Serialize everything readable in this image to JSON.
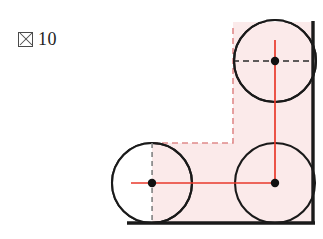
{
  "figure": {
    "caption": {
      "glyph_name": "tofu-box-glyph",
      "glyph_char": "図",
      "number": "10"
    },
    "colors": {
      "fill_pink": "#fbeaea",
      "stroke_red": "#e8392b",
      "stroke_pink_dashed": "#e89a9a",
      "stroke_black": "#1a1a1a",
      "stroke_gray_dashed": "#8a8a8a",
      "background": "#ffffff"
    },
    "geometry": {
      "circles": [
        {
          "name": "circle-top-right",
          "cx": 275,
          "cy": 61,
          "r": 41
        },
        {
          "name": "circle-bottom-left",
          "cx": 152,
          "cy": 183,
          "r": 40
        },
        {
          "name": "circle-bottom-right",
          "cx": 275,
          "cy": 183,
          "r": 40
        }
      ],
      "centers": [
        {
          "name": "center-dot-top-right",
          "x": 275,
          "y": 61
        },
        {
          "name": "center-dot-bottom-left",
          "x": 152,
          "y": 183
        },
        {
          "name": "center-dot-bottom-right",
          "x": 275,
          "y": 183
        }
      ],
      "walls": {
        "right_wall": {
          "x": 313,
          "y1": 22,
          "y2": 224
        },
        "bottom_wall": {
          "y": 223,
          "x1": 128,
          "x2": 314
        }
      },
      "region_outline_dashed": [
        {
          "name": "dashed-vertical-left-upper",
          "x": 233,
          "y1": 28,
          "y2": 143
        },
        {
          "name": "dashed-horizontal-shelf",
          "y": 143,
          "x1": 152,
          "x2": 233
        }
      ],
      "dashed_black_through_top_center": {
        "y": 61,
        "x1": 233,
        "x2": 313
      },
      "dashed_gray_through_left_center": {
        "x": 152,
        "y1": 143,
        "y2": 223
      },
      "red_axes": [
        {
          "name": "red-vertical-axis-top",
          "x": 275,
          "y1": 40,
          "y2": 183
        },
        {
          "name": "red-horizontal-axis-bottom",
          "y": 183,
          "x1": 131,
          "x2": 275
        }
      ],
      "filled_region_path": "M152,143 L233,143 L233,22 L313,22 L313,223 L152,223 Z"
    }
  }
}
